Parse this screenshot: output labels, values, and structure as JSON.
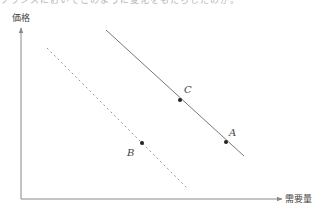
{
  "top_fragment": {
    "text": "フランスにおいてこのように変化をもたらしたのか。"
  },
  "diagram": {
    "y_axis_label": "価格",
    "x_axis_label": "需要量",
    "colors": {
      "axis": "#888888",
      "solid_line": "#777777",
      "dashed_line": "#999999",
      "point": "#222222",
      "label": "#444444"
    },
    "lines": [
      {
        "name": "demand-curve-original",
        "style": "solid",
        "from": [
          106,
          30
        ],
        "to": [
          244,
          156
        ]
      },
      {
        "name": "demand-curve-shifted",
        "style": "dashed",
        "from": [
          47,
          48
        ],
        "to": [
          187,
          188
        ]
      }
    ],
    "points": [
      {
        "label": "A",
        "x": 226,
        "y": 142,
        "label_x": 229,
        "label_y": 136
      },
      {
        "label": "B",
        "x": 142,
        "y": 143,
        "label_x": 127,
        "label_y": 156
      },
      {
        "label": "C",
        "x": 180,
        "y": 100,
        "label_x": 184,
        "label_y": 93
      }
    ]
  }
}
